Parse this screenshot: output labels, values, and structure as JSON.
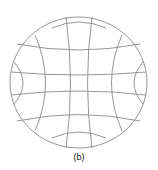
{
  "figure": {
    "caption": "(b)",
    "stroke_color": "#8a8a8a"
  }
}
